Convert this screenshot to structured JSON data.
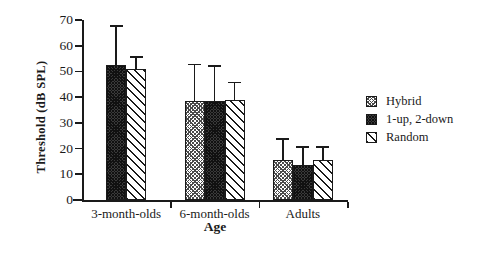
{
  "chart_data": {
    "type": "bar",
    "title": "",
    "xlabel": "Age",
    "ylabel": "Threshold  (dB  SPL)",
    "categories": [
      "3-month-olds",
      "6-month-olds",
      "Adults"
    ],
    "ylim": [
      0,
      70
    ],
    "yticks": [
      0,
      10,
      20,
      30,
      40,
      50,
      60,
      70
    ],
    "ytick_labels": [
      "0",
      "10",
      "20",
      "30",
      "40",
      "50",
      "60",
      "70"
    ],
    "grid": false,
    "legend_position": "right",
    "error_bars": "standard deviation",
    "series": [
      {
        "name": "Hybrid",
        "pattern": "light-cross-hatch",
        "values": [
          null,
          38.5,
          15.5
        ],
        "errors": [
          null,
          14.5,
          8.5
        ]
      },
      {
        "name": "1-up, 2-down",
        "pattern": "dense-dark",
        "values": [
          52.5,
          38.5,
          13.5
        ],
        "errors": [
          15.5,
          14.0,
          7.5
        ]
      },
      {
        "name": "Random",
        "pattern": "sparse-diagonal",
        "values": [
          51.0,
          39.0,
          15.5
        ],
        "errors": [
          5.0,
          7.0,
          5.5
        ]
      }
    ]
  },
  "legend": {
    "items": [
      {
        "label": "Hybrid"
      },
      {
        "label": "1-up, 2-down"
      },
      {
        "label": "Random"
      }
    ]
  },
  "colors": {
    "axis": "#1a1a1a",
    "text": "#1a1a1a",
    "background": "#ffffff",
    "dark_fill": "#3a3a3a"
  }
}
